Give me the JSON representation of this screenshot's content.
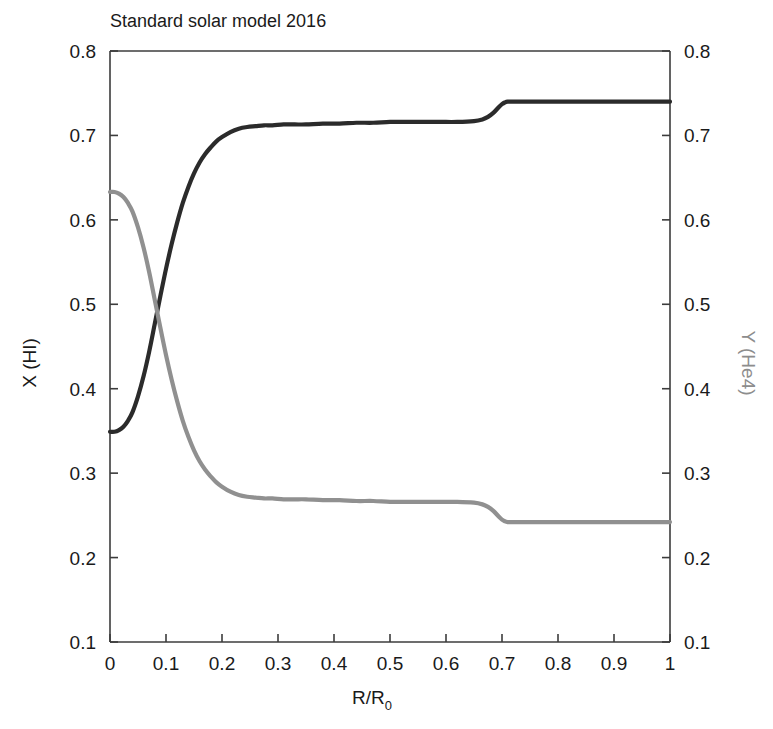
{
  "chart_data": {
    "type": "line",
    "title": "Standard solar model 2016",
    "xlabel": "R/R",
    "xlabel_sub": "0",
    "ylabel_left": "X (HI)",
    "ylabel_right": "Y (He4)",
    "xlim": [
      0,
      1
    ],
    "ylim_left": [
      0.1,
      0.8
    ],
    "ylim_right": [
      0.1,
      0.8
    ],
    "grid": false,
    "legend": "none",
    "xticks": [
      "0",
      "0.1",
      "0.2",
      "0.3",
      "0.4",
      "0.5",
      "0.6",
      "0.7",
      "0.8",
      "0.9",
      "1"
    ],
    "xtick_values": [
      0,
      0.1,
      0.2,
      0.3,
      0.4,
      0.5,
      0.6,
      0.7,
      0.8,
      0.9,
      1
    ],
    "yticks_left": [
      "0.1",
      "0.2",
      "0.3",
      "0.4",
      "0.5",
      "0.6",
      "0.7",
      "0.8"
    ],
    "ytick_values_left": [
      0.1,
      0.2,
      0.3,
      0.4,
      0.5,
      0.6,
      0.7,
      0.8
    ],
    "yticks_right": [
      "0.1",
      "0.2",
      "0.3",
      "0.4",
      "0.5",
      "0.6",
      "0.7",
      "0.8"
    ],
    "ytick_values_right": [
      0.1,
      0.2,
      0.3,
      0.4,
      0.5,
      0.6,
      0.7,
      0.8
    ],
    "colors": {
      "hydrogen": "#2b2b2b",
      "helium": "#909090",
      "axis": "#3c3c3c",
      "background": "#ffffff"
    },
    "annotations": {
      "crossover_x": 0.08,
      "crossover_y": 0.49,
      "convective_boundary_x": 0.705
    },
    "series": [
      {
        "name": "X (HI)",
        "color": "#2b2b2b",
        "axis": "left",
        "x": [
          0.0,
          0.008,
          0.016,
          0.024,
          0.032,
          0.04,
          0.05,
          0.06,
          0.07,
          0.08,
          0.09,
          0.1,
          0.11,
          0.12,
          0.13,
          0.14,
          0.15,
          0.16,
          0.17,
          0.18,
          0.19,
          0.2,
          0.215,
          0.23,
          0.245,
          0.26,
          0.275,
          0.29,
          0.31,
          0.33,
          0.35,
          0.38,
          0.41,
          0.44,
          0.47,
          0.5,
          0.53,
          0.56,
          0.59,
          0.62,
          0.65,
          0.665,
          0.675,
          0.685,
          0.695,
          0.7,
          0.705,
          0.71,
          0.72,
          0.75,
          0.8,
          0.85,
          0.9,
          0.95,
          1.0
        ],
        "y": [
          0.349,
          0.349,
          0.351,
          0.355,
          0.362,
          0.372,
          0.391,
          0.415,
          0.444,
          0.477,
          0.51,
          0.542,
          0.571,
          0.597,
          0.62,
          0.639,
          0.655,
          0.668,
          0.678,
          0.686,
          0.693,
          0.698,
          0.704,
          0.708,
          0.71,
          0.711,
          0.712,
          0.712,
          0.713,
          0.713,
          0.713,
          0.714,
          0.714,
          0.715,
          0.715,
          0.716,
          0.716,
          0.716,
          0.716,
          0.716,
          0.717,
          0.719,
          0.722,
          0.727,
          0.734,
          0.737,
          0.739,
          0.74,
          0.74,
          0.74,
          0.74,
          0.74,
          0.74,
          0.74,
          0.74
        ]
      },
      {
        "name": "Y (He4)",
        "color": "#909090",
        "axis": "right",
        "x": [
          0.0,
          0.008,
          0.016,
          0.024,
          0.032,
          0.04,
          0.05,
          0.06,
          0.07,
          0.08,
          0.09,
          0.1,
          0.11,
          0.12,
          0.13,
          0.14,
          0.15,
          0.16,
          0.17,
          0.18,
          0.19,
          0.2,
          0.215,
          0.23,
          0.245,
          0.26,
          0.275,
          0.29,
          0.31,
          0.33,
          0.35,
          0.38,
          0.41,
          0.44,
          0.47,
          0.5,
          0.53,
          0.56,
          0.59,
          0.62,
          0.65,
          0.665,
          0.675,
          0.685,
          0.695,
          0.7,
          0.705,
          0.71,
          0.72,
          0.75,
          0.8,
          0.85,
          0.9,
          0.95,
          1.0
        ],
        "y": [
          0.633,
          0.633,
          0.631,
          0.627,
          0.62,
          0.61,
          0.591,
          0.567,
          0.538,
          0.505,
          0.472,
          0.44,
          0.411,
          0.385,
          0.362,
          0.343,
          0.327,
          0.314,
          0.304,
          0.296,
          0.289,
          0.284,
          0.278,
          0.274,
          0.272,
          0.271,
          0.27,
          0.27,
          0.269,
          0.269,
          0.269,
          0.268,
          0.268,
          0.267,
          0.267,
          0.266,
          0.266,
          0.266,
          0.266,
          0.266,
          0.265,
          0.263,
          0.26,
          0.255,
          0.248,
          0.245,
          0.243,
          0.242,
          0.242,
          0.242,
          0.242,
          0.242,
          0.242,
          0.242,
          0.242
        ]
      }
    ]
  },
  "plot": {
    "title": "Standard solar model 2016",
    "x_axis_title_main": "R/R",
    "x_axis_title_sub": "0",
    "y_axis_left_title": "X (HI)",
    "y_axis_right_title": "Y (He4)"
  }
}
